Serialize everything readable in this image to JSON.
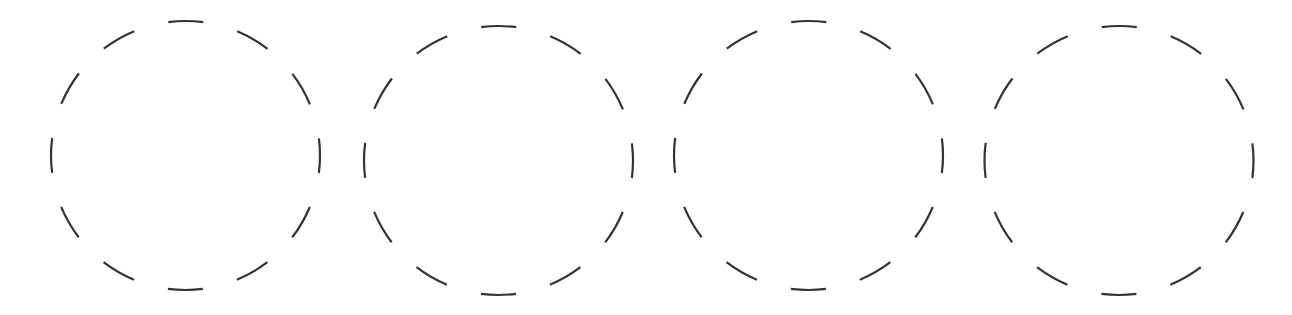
{
  "diagram": {
    "background": "#ffffff",
    "stroke_color": "#333333",
    "stroke_width": 2.2,
    "dash_count": 12,
    "circles": [
      {
        "id": "circle-1",
        "cx": 185.5,
        "cy": 155.5,
        "r": 134.5
      },
      {
        "id": "circle-2",
        "cx": 498.5,
        "cy": 160.5,
        "r": 134.5
      },
      {
        "id": "circle-3",
        "cx": 808.5,
        "cy": 155.5,
        "r": 134.5
      },
      {
        "id": "circle-4",
        "cx": 1119,
        "cy": 160.5,
        "r": 134.5
      }
    ]
  }
}
